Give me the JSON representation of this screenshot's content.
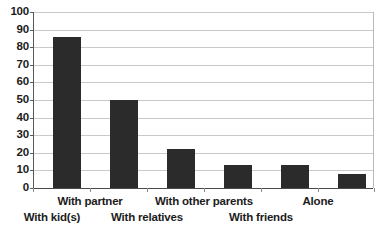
{
  "chart_data": {
    "type": "bar",
    "title": "",
    "subtitle": "",
    "xlabel": "",
    "ylabel": "",
    "categories": [
      "With kid(s)",
      "With partner",
      "With relatives",
      "With other parents",
      "With friends",
      "Alone"
    ],
    "values": [
      86,
      50,
      22,
      13,
      13,
      8
    ],
    "ylim": [
      0,
      100
    ],
    "ytick_step": 10,
    "ytick_labels": [
      "100",
      "90",
      "80",
      "70",
      "60",
      "50",
      "40",
      "30",
      "20",
      "10",
      "0"
    ],
    "grid": "horizontal",
    "legend": "none",
    "label_layout": "staggered-two-rows",
    "label_rows": [
      1,
      0,
      1,
      0,
      1,
      0
    ],
    "colors": {
      "bar": "#2b2b2b",
      "gridline": "#c9c9c9",
      "axis": "#585858",
      "baseline": "#4a4a4a",
      "text": "#1c1c1c",
      "background": "#ffffff"
    }
  }
}
